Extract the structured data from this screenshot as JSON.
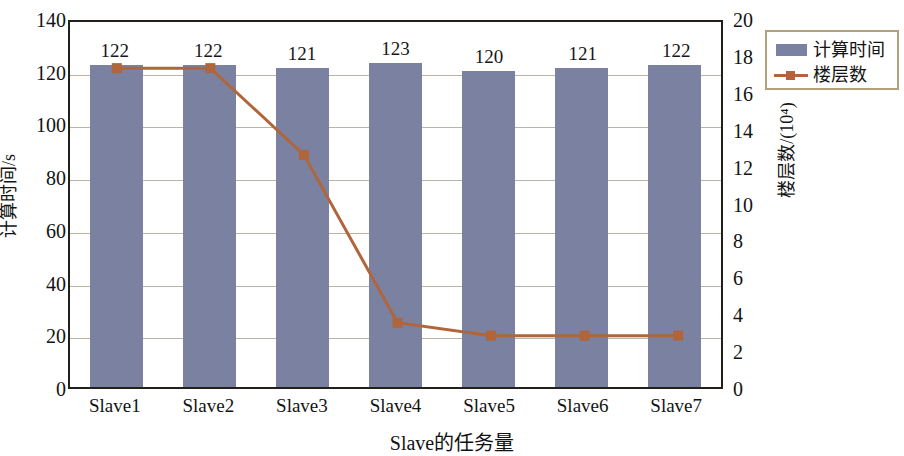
{
  "chart_data": {
    "type": "bar",
    "title": "",
    "xlabel": "Slave的任务量",
    "ylabel": "计算时间/s",
    "ylabel_right": "楼层数/(10⁴)",
    "categories": [
      "Slave1",
      "Slave2",
      "Slave3",
      "Slave4",
      "Slave5",
      "Slave6",
      "Slave7"
    ],
    "ylim": [
      0,
      140
    ],
    "ylim_right": [
      0,
      20
    ],
    "yticks": [
      0,
      20,
      40,
      60,
      80,
      100,
      120,
      140
    ],
    "yticks_right": [
      0,
      2,
      4,
      6,
      8,
      10,
      12,
      14,
      16,
      18,
      20
    ],
    "grid": true,
    "legend_position": "top-right",
    "series": [
      {
        "name": "计算时间",
        "type": "bar",
        "axis": "left",
        "color": "#7b81a0",
        "values": [
          122,
          122,
          121,
          123,
          120,
          121,
          122
        ],
        "data_labels": [
          "122",
          "122",
          "121",
          "123",
          "120",
          "121",
          "122"
        ]
      },
      {
        "name": "楼层数",
        "type": "line",
        "axis": "right",
        "color": "#b0653a",
        "values": [
          17.5,
          17.5,
          12.8,
          3.7,
          3.0,
          3.0,
          3.0
        ]
      }
    ]
  },
  "legend": {
    "items": [
      {
        "label": "计算时间",
        "marker": "bar-swatch-icon",
        "color": "#7b81a0"
      },
      {
        "label": "楼层数",
        "marker": "line-marker-icon",
        "color": "#b0653a"
      }
    ]
  }
}
